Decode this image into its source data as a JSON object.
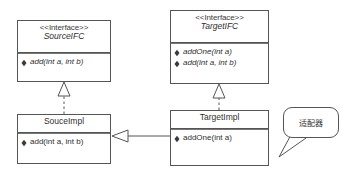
{
  "diagram": {
    "kind": "uml-class-diagram",
    "stroke_color": "#555555",
    "text_color": "#2f2f2f",
    "background": "#ffffff",
    "classes": [
      {
        "id": "source-ifc",
        "stereotype": "<<Interface>>",
        "name": "SourceIFC",
        "abstract": true,
        "members": [
          "add(int a, int b)"
        ],
        "x": 17,
        "y": 20,
        "w": 94,
        "h": 62,
        "header_h": 32
      },
      {
        "id": "target-ifc",
        "stereotype": "<<Interface>>",
        "name": "TargetIFC",
        "abstract": true,
        "members": [
          "addOne(int a)",
          "add(int a, int b)"
        ],
        "x": 170,
        "y": 10,
        "w": 99,
        "h": 74,
        "header_h": 32
      },
      {
        "id": "source-impl",
        "stereotype": "",
        "name": "SouceImpl",
        "abstract": false,
        "members": [
          "add(int a, int b)"
        ],
        "x": 17,
        "y": 114,
        "w": 94,
        "h": 50,
        "header_h": 18
      },
      {
        "id": "target-impl",
        "stereotype": "",
        "name": "TargetImpl",
        "abstract": false,
        "members": [
          "addOne(int a)"
        ],
        "x": 170,
        "y": 110,
        "w": 99,
        "h": 56,
        "header_h": 18
      }
    ],
    "relations": [
      {
        "id": "realize-source",
        "type": "realization",
        "from": "source-impl",
        "to": "source-ifc",
        "line_style": "dashed",
        "arrow": "hollow-triangle"
      },
      {
        "id": "realize-target",
        "type": "realization",
        "from": "target-impl",
        "to": "target-ifc",
        "line_style": "dashed",
        "arrow": "hollow-triangle"
      },
      {
        "id": "generalize-impl",
        "type": "generalization",
        "from": "target-impl",
        "to": "source-impl",
        "line_style": "solid",
        "arrow": "hollow-triangle"
      }
    ],
    "callout": {
      "id": "adapter-note",
      "text": "适配器",
      "x": 283,
      "y": 107,
      "w": 56,
      "h": 31,
      "tail_points": "291,134 305,137 281,156"
    }
  }
}
